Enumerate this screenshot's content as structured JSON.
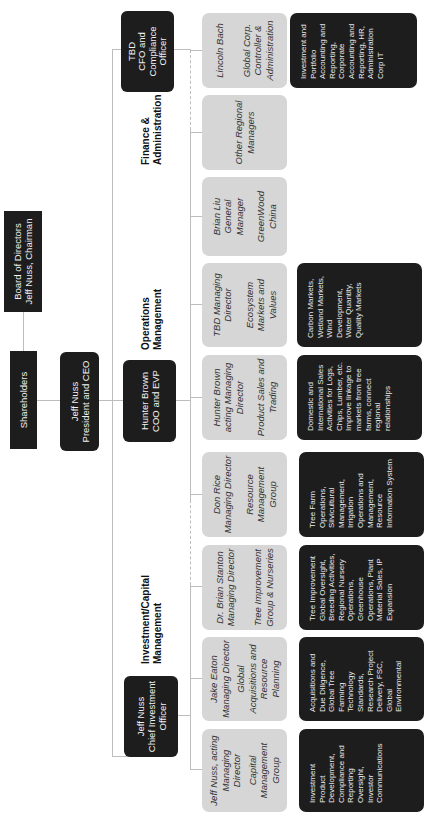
{
  "top": {
    "board": {
      "line1": "Board of Directors",
      "line2": "Jeff Nuss, Chairman"
    },
    "shareholders": {
      "label": "Shareholders"
    },
    "ceo": {
      "line1": "Jeff Nuss",
      "line2": "President and CEO"
    }
  },
  "sections": {
    "investment": {
      "label_line1": "Investment/Capital",
      "label_line2": "Management"
    },
    "operations": {
      "label_line1": "Operations",
      "label_line2": "Management"
    },
    "finance": {
      "label_line1": "Finance &",
      "label_line2": "Administration"
    }
  },
  "executives": {
    "cio": {
      "line1": "Jeff Nuss",
      "line2": "Chief Investment",
      "line3": "Officer"
    },
    "coo": {
      "line1": "Hunter Brown",
      "line2": "COO and EVP"
    },
    "cfo": {
      "line1": "TBD",
      "line2": "CFO and",
      "line3": "Compliance",
      "line4": "Officer"
    }
  },
  "units": [
    {
      "name": "Jeff Nuss, acting Managing Director",
      "unit": "Capital Management Group",
      "desc": "Investment Product Development, Compliance and Reporting Oversight, Investor Communications"
    },
    {
      "name": "Jake Eaton Managing Director",
      "unit": "Global Acquisitions and Resource Planning",
      "desc": "Acquisitions and Due Diligence, Global Tree Farming Technology Standards, Research Project Delivery, FSC, Global Environmental"
    },
    {
      "name": "Dr. Brian Stanton Managing Director",
      "unit": "Tree Improvement Group & Nurseries",
      "desc": "Tree Improvement Global Oversight, Breeding Activities, Regional Nursery Operations, Greenhouse Operations, Plant Material Sales, IP Expansion"
    },
    {
      "name": "Don Rice Managing Director",
      "unit": "Resource Management Group",
      "desc": "Tree Farm Operations, Silvicultural Management, Irrigation Operations and Management, Resource Information System"
    },
    {
      "name": "Hunter Brown acting Managing Director",
      "unit": "Product Sales and Trading",
      "desc": "Domestic and International Sales Activities for Logs, Chips, Lumber, etc. Improve linkage to markets from tree farms, connect regional relationships"
    },
    {
      "name": "TBD Managing Director",
      "unit": "Ecosystem Markets and Values",
      "desc": "Carbon Markets, Wetland Markets, Wind Development, Water Quantity, Quality Markets"
    },
    {
      "name": "Brian Liu General Manager",
      "unit": "GreenWood China",
      "desc": ""
    },
    {
      "name": "",
      "unit": "Other Regional Managers",
      "desc": ""
    },
    {
      "name": "Lincoln Bach",
      "unit": "Global Corp. Controller & Administration",
      "desc": "Investment and Portfolio Accounting and Reporting, Corporate Accounting and Reporting, HR, Administration Corp IT"
    }
  ],
  "colors": {
    "dark_box": "#1d1d1d",
    "gray_box": "#d6d6d6",
    "connector": "#bdbdbd"
  }
}
